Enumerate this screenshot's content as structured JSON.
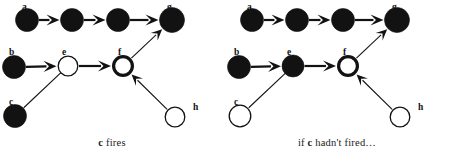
{
  "figure": {
    "colors": {
      "ink": "#121212",
      "fill_fired": "#121212",
      "fill_unfired": "#ffffff",
      "background": "#ffffff"
    }
  },
  "panels": [
    {
      "id": "left",
      "caption_parts": {
        "pre": "",
        "em": "c",
        "post": " fires"
      },
      "caption_text": "c fires",
      "nodes": [
        {
          "id": "a",
          "label": "a",
          "x": 27,
          "y": 20,
          "r": 11.5,
          "state": "fired",
          "style": "solid",
          "label_x": 22,
          "label_y": 4
        },
        {
          "id": "a2",
          "label": "",
          "x": 72,
          "y": 20,
          "r": 11.5,
          "state": "fired",
          "style": "solid",
          "label_x": 67,
          "label_y": 4
        },
        {
          "id": "a3",
          "label": "",
          "x": 118,
          "y": 20,
          "r": 11.5,
          "state": "fired",
          "style": "solid",
          "label_x": 113,
          "label_y": 4
        },
        {
          "id": "g",
          "label": "g",
          "x": 172,
          "y": 20,
          "r": 12.5,
          "state": "fired",
          "style": "solid",
          "label_x": 167,
          "label_y": 4
        },
        {
          "id": "b",
          "label": "b",
          "x": 14,
          "y": 67,
          "r": 11.5,
          "state": "fired",
          "style": "solid",
          "label_x": 9,
          "label_y": 49
        },
        {
          "id": "e",
          "label": "e",
          "x": 68,
          "y": 66,
          "r": 10.5,
          "state": "unfired",
          "style": "thin-ring",
          "label_x": 62,
          "label_y": 49
        },
        {
          "id": "f",
          "label": "f",
          "x": 123,
          "y": 66,
          "r": 11.0,
          "state": "unfired",
          "style": "thick-ring",
          "label_x": 118,
          "label_y": 49
        },
        {
          "id": "c",
          "label": "c",
          "x": 15,
          "y": 116,
          "r": 11.5,
          "state": "fired",
          "style": "solid",
          "label_x": 9,
          "label_y": 99
        },
        {
          "id": "h",
          "label": "h",
          "x": 175,
          "y": 117,
          "r": 10.5,
          "state": "unfired",
          "style": "thin-ring",
          "label_x": 193,
          "label_y": 104
        }
      ],
      "edges": [
        {
          "from": "a",
          "to": "a2",
          "kind": "arrow"
        },
        {
          "from": "a2",
          "to": "a3",
          "kind": "arrow"
        },
        {
          "from": "a3",
          "to": "g",
          "kind": "arrow"
        },
        {
          "from": "b",
          "to": "e",
          "kind": "arrow"
        },
        {
          "from": "e",
          "to": "f",
          "kind": "arrow"
        },
        {
          "from": "c",
          "to": "e",
          "kind": "inhibit"
        },
        {
          "from": "h",
          "to": "f",
          "kind": "arrow"
        },
        {
          "from": "f",
          "to": "g",
          "kind": "arrow"
        }
      ]
    },
    {
      "id": "right",
      "caption_parts": {
        "pre": "if ",
        "em": "c",
        "post": " hadn't fired…"
      },
      "caption_text": "if c hadn't fired…",
      "nodes": [
        {
          "id": "a",
          "label": "a",
          "x": 27,
          "y": 20,
          "r": 11.5,
          "state": "fired",
          "style": "solid",
          "label_x": 22,
          "label_y": 4
        },
        {
          "id": "a2",
          "label": "",
          "x": 72,
          "y": 20,
          "r": 11.5,
          "state": "fired",
          "style": "solid",
          "label_x": 67,
          "label_y": 4
        },
        {
          "id": "a3",
          "label": "",
          "x": 118,
          "y": 20,
          "r": 11.5,
          "state": "fired",
          "style": "solid",
          "label_x": 113,
          "label_y": 4
        },
        {
          "id": "g",
          "label": "g",
          "x": 172,
          "y": 20,
          "r": 12.5,
          "state": "fired",
          "style": "solid",
          "label_x": 167,
          "label_y": 4
        },
        {
          "id": "b",
          "label": "b",
          "x": 14,
          "y": 67,
          "r": 11.5,
          "state": "fired",
          "style": "solid",
          "label_x": 9,
          "label_y": 49
        },
        {
          "id": "e",
          "label": "e",
          "x": 68,
          "y": 66,
          "r": 11.0,
          "state": "fired",
          "style": "solid",
          "label_x": 62,
          "label_y": 49
        },
        {
          "id": "f",
          "label": "f",
          "x": 123,
          "y": 66,
          "r": 11.0,
          "state": "unfired",
          "style": "thick-ring",
          "label_x": 118,
          "label_y": 49
        },
        {
          "id": "c",
          "label": "c",
          "x": 15,
          "y": 116,
          "r": 11.5,
          "state": "unfired",
          "style": "thin-ring",
          "label_x": 9,
          "label_y": 99
        },
        {
          "id": "h",
          "label": "h",
          "x": 175,
          "y": 117,
          "r": 10.5,
          "state": "unfired",
          "style": "thin-ring",
          "label_x": 193,
          "label_y": 104
        }
      ],
      "edges": [
        {
          "from": "a",
          "to": "a2",
          "kind": "arrow"
        },
        {
          "from": "a2",
          "to": "a3",
          "kind": "arrow"
        },
        {
          "from": "a3",
          "to": "g",
          "kind": "arrow"
        },
        {
          "from": "b",
          "to": "e",
          "kind": "arrow"
        },
        {
          "from": "e",
          "to": "f",
          "kind": "arrow"
        },
        {
          "from": "c",
          "to": "e",
          "kind": "inhibit"
        },
        {
          "from": "h",
          "to": "f",
          "kind": "arrow"
        },
        {
          "from": "f",
          "to": "g",
          "kind": "arrow"
        }
      ]
    }
  ]
}
